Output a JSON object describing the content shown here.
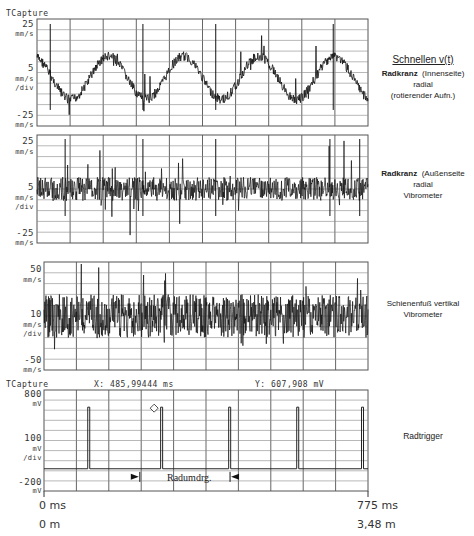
{
  "chart_data": [
    {
      "type": "line",
      "title": "Schnellen v(t)",
      "panel": 1,
      "header": "TCapture",
      "description": [
        "Radkranz (Innenseite)",
        "radial",
        "(rotierender Aufn.)"
      ],
      "y_ticks": {
        "top": "25",
        "top_unit": "mm/s",
        "mid": "5",
        "mid_unit": "mm/s",
        "mid_unit2": "/div",
        "bottom": "-25",
        "bottom_unit": "mm/s"
      },
      "ylim": [
        -25,
        25
      ],
      "ylabel": "mm/s",
      "grid": true,
      "shape": "sinusoid ~4.5 periods with noise and spikes",
      "approx_peaks_x_frac": [
        0.11,
        0.38,
        0.62,
        0.88
      ],
      "approx_troughs_x_frac": [
        0.0,
        0.24,
        0.5,
        0.76,
        1.0
      ]
    },
    {
      "type": "line",
      "panel": 2,
      "description": [
        "Radkranz (Außenseite",
        "radial",
        "Vibrometer"
      ],
      "y_ticks": {
        "top": "25",
        "top_unit": "mm/s",
        "mid": "5",
        "mid_unit": "mm/s",
        "mid_unit2": "/div",
        "bottom": "-25",
        "bottom_unit": "mm/s"
      },
      "ylim": [
        -25,
        25
      ],
      "ylabel": "mm/s",
      "grid": true,
      "shape": "broadband noise around 0 with periodic spikes"
    },
    {
      "type": "line",
      "panel": 3,
      "description": [
        "Schienenfuß vertikal",
        "Vibrometer"
      ],
      "y_ticks": {
        "top": "50",
        "top_unit": "mm/s",
        "mid": "10",
        "mid_unit": "mm/s",
        "mid_unit2": "/div",
        "bottom": "-50",
        "bottom_unit": "mm/s"
      },
      "ylim": [
        -50,
        50
      ],
      "ylabel": "mm/s",
      "grid": true,
      "shape": "broadband noise"
    },
    {
      "type": "line",
      "panel": 4,
      "header": "TCapture",
      "cursor_x": "X: 485,99444 ms",
      "cursor_y": "Y: 607,908 mV",
      "description": [
        "Radtrigger"
      ],
      "y_ticks": {
        "top": "800",
        "top_unit": "mV",
        "mid": "100",
        "mid_unit": "mV",
        "mid_unit2": "/div",
        "bottom": "-200",
        "bottom_unit": "mV"
      },
      "ylim": [
        -200,
        800
      ],
      "ylabel": "mV",
      "grid": true,
      "trigger_pulse_x_frac": [
        0.135,
        0.36,
        0.57,
        0.78,
        0.98
      ],
      "pulse_level_mV": 600,
      "baseline_mV": -100,
      "annotation": "Radumdrg."
    }
  ],
  "header": {
    "tcapture": "TCapture",
    "cursor_x": "X: 485,99444 ms",
    "cursor_y": "Y: 607,908 mV"
  },
  "title": "Schnellen  v(t)",
  "panels": {
    "p1": {
      "top": "25",
      "top_u": "mm/s",
      "mid": "5",
      "mid_u": "mm/s",
      "mid_u2": "/div",
      "bot": "-25",
      "bot_u": "mm/s",
      "line1": "Radkranz",
      "line1b": "(Innenseite)",
      "line2": "radial",
      "line3": "(rotierender  Aufn.)"
    },
    "p2": {
      "top": "25",
      "top_u": "mm/s",
      "mid": "5",
      "mid_u": "mm/s",
      "mid_u2": "/div",
      "bot": "-25",
      "bot_u": "mm/s",
      "line1": "Radkranz",
      "line1b": "(Außenseite",
      "line2": "radial",
      "line3": "Vibrometer"
    },
    "p3": {
      "top": "50",
      "top_u": "mm/s",
      "mid": "10",
      "mid_u": "mm/s",
      "mid_u2": "/div",
      "bot": "-50",
      "bot_u": "mm/s",
      "line1": "Schienenfuß    vertikal",
      "line2": "Vibrometer"
    },
    "p4": {
      "top": "800",
      "top_u": "mV",
      "mid": "100",
      "mid_u": "mV",
      "mid_u2": "/div",
      "bot": "-200",
      "bot_u": "mV",
      "line1": "Radtrigger",
      "annotation": "Radumdrg."
    }
  },
  "xaxis": {
    "start_ms": "0 ms",
    "start_m": "0 m",
    "end_ms": "775 ms",
    "end_m": "3,48 m"
  }
}
